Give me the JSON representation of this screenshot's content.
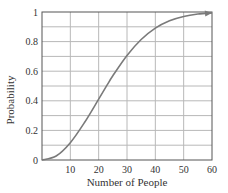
{
  "chart_data": {
    "type": "line",
    "title": "",
    "xlabel": "Number of People",
    "ylabel": "Probability",
    "xlim": [
      0,
      60
    ],
    "ylim": [
      0,
      1
    ],
    "x_ticks": [
      10,
      20,
      30,
      40,
      50,
      60
    ],
    "y_ticks": [
      0,
      0.2,
      0.4,
      0.6,
      0.8,
      1
    ],
    "x_tick_labels": [
      "10",
      "20",
      "30",
      "40",
      "50",
      "60"
    ],
    "y_tick_labels": [
      "0",
      "0.2",
      "0.4",
      "0.6",
      "0.8",
      "1"
    ],
    "grid": true,
    "grid_x_step": 10,
    "grid_y_step": 0.1,
    "legend": null,
    "series": [
      {
        "name": "Probability",
        "color": "#7a7a7a",
        "arrow_end": true,
        "x": [
          0,
          5,
          10,
          15,
          20,
          23,
          25,
          30,
          35,
          40,
          45,
          50,
          55,
          60
        ],
        "y": [
          0,
          0.027,
          0.117,
          0.253,
          0.411,
          0.507,
          0.569,
          0.706,
          0.814,
          0.891,
          0.941,
          0.97,
          0.986,
          0.994
        ]
      }
    ]
  },
  "colors": {
    "axis": "#555555",
    "grid": "#b8b8b8",
    "curve": "#7a7a7a",
    "text": "#333333"
  }
}
